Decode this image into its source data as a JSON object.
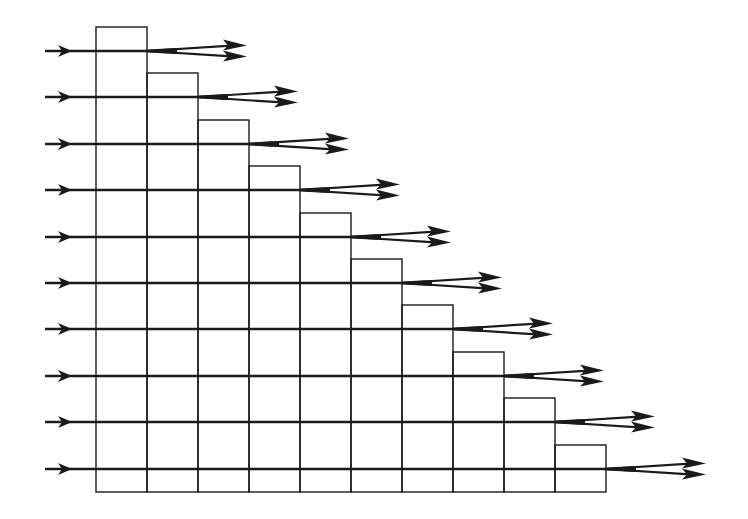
{
  "diagram": {
    "type": "staircase-grid-with-arrows",
    "columns": 10,
    "rows": 10,
    "grid": {
      "left": 96,
      "column_width": 51,
      "bottom": 492,
      "row_lines_y": [
        51,
        97,
        144,
        190,
        237,
        283,
        329,
        376,
        422,
        469
      ],
      "bar_top_offset": 24
    },
    "input_arrows": {
      "x_start": 45,
      "x_head": 72
    },
    "output_arrows": {
      "length": 100,
      "spread": 9
    },
    "colors": {
      "stroke": "#1a1a1a",
      "background": "#ffffff"
    }
  }
}
